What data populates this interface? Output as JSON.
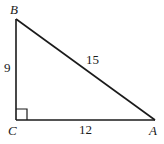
{
  "diagram": {
    "type": "right-triangle",
    "vertices": [
      {
        "name": "B",
        "label": "B"
      },
      {
        "name": "C",
        "label": "C"
      },
      {
        "name": "A",
        "label": "A"
      }
    ],
    "sides": [
      {
        "between": "BC",
        "label": "9"
      },
      {
        "between": "CA",
        "label": "12"
      },
      {
        "between": "AB",
        "label": "15"
      }
    ],
    "right_angle_at": "C",
    "colors": {
      "stroke": "#1a1a1a",
      "background": "#ffffff"
    }
  }
}
